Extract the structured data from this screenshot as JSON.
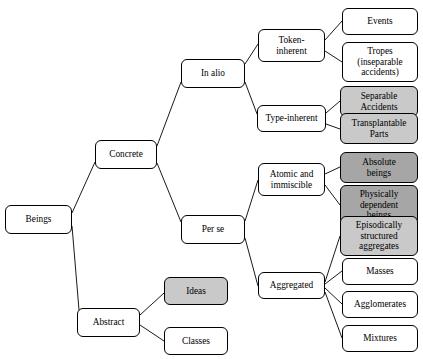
{
  "diagram": {
    "colors": {
      "stroke": "#000000",
      "background": "#ffffff",
      "fill_light": "#c9c9c9",
      "fill_dark": "#a6a6a6"
    },
    "nodes": [
      {
        "id": "beings",
        "label": "Beings",
        "x": 5,
        "y": 205,
        "w": 67,
        "h": 29,
        "fill": "none"
      },
      {
        "id": "concrete",
        "label": "Concrete",
        "x": 95,
        "y": 140,
        "w": 62,
        "h": 29,
        "fill": "none"
      },
      {
        "id": "abstract",
        "label": "Abstract",
        "x": 77,
        "y": 308,
        "w": 63,
        "h": 29,
        "fill": "none"
      },
      {
        "id": "in-alio",
        "label": "In alio",
        "x": 181,
        "y": 59,
        "w": 64,
        "h": 29,
        "fill": "none"
      },
      {
        "id": "per-se",
        "label": "Per se",
        "x": 181,
        "y": 215,
        "w": 64,
        "h": 29,
        "fill": "none"
      },
      {
        "id": "ideas",
        "label": "Ideas",
        "x": 164,
        "y": 277,
        "w": 64,
        "h": 28,
        "fill": "light"
      },
      {
        "id": "classes",
        "label": "Classes",
        "x": 164,
        "y": 327,
        "w": 64,
        "h": 28,
        "fill": "none"
      },
      {
        "id": "token-inherent",
        "label": "Token-\ninherent",
        "x": 258,
        "y": 29,
        "w": 67,
        "h": 33,
        "fill": "none"
      },
      {
        "id": "type-inherent",
        "label": "Type-inherent",
        "x": 257,
        "y": 105,
        "w": 69,
        "h": 27,
        "fill": "none"
      },
      {
        "id": "atomic",
        "label": "Atomic and\nimmiscible",
        "x": 258,
        "y": 163,
        "w": 67,
        "h": 33,
        "fill": "none"
      },
      {
        "id": "aggregated",
        "label": "Aggregated",
        "x": 258,
        "y": 272,
        "w": 67,
        "h": 27,
        "fill": "none"
      },
      {
        "id": "events",
        "label": "Events",
        "x": 342,
        "y": 8,
        "w": 76,
        "h": 27,
        "fill": "none"
      },
      {
        "id": "tropes",
        "label": "Tropes\n(inseparable\naccidents)",
        "x": 342,
        "y": 42,
        "w": 76,
        "h": 40,
        "fill": "none"
      },
      {
        "id": "separable",
        "label": "Separable\nAccidents",
        "x": 340,
        "y": 86,
        "w": 78,
        "h": 31,
        "fill": "light"
      },
      {
        "id": "transplantable",
        "label": "Transplantable\nParts",
        "x": 340,
        "y": 113,
        "w": 78,
        "h": 31,
        "fill": "light"
      },
      {
        "id": "absolute",
        "label": "Absolute\nbeings",
        "x": 340,
        "y": 152,
        "w": 78,
        "h": 31,
        "fill": "dark"
      },
      {
        "id": "physically",
        "label": "Physically\ndependent\nbeings",
        "x": 340,
        "y": 185,
        "w": 78,
        "h": 40,
        "fill": "dark"
      },
      {
        "id": "episodically",
        "label": "Episodically\nstructured\naggregates",
        "x": 340,
        "y": 216,
        "w": 78,
        "h": 40,
        "fill": "light"
      },
      {
        "id": "masses",
        "label": "Masses",
        "x": 342,
        "y": 258,
        "w": 76,
        "h": 27,
        "fill": "none"
      },
      {
        "id": "agglomerates",
        "label": "Agglomerates",
        "x": 342,
        "y": 291,
        "w": 76,
        "h": 27,
        "fill": "none"
      },
      {
        "id": "mixtures",
        "label": "Mixtures",
        "x": 342,
        "y": 325,
        "w": 76,
        "h": 27,
        "fill": "none"
      }
    ],
    "edges": [
      {
        "from": "beings",
        "to": "concrete",
        "x1": 72,
        "y1": 213,
        "x2": 95,
        "y2": 162
      },
      {
        "from": "beings",
        "to": "abstract",
        "x1": 72,
        "y1": 226,
        "x2": 79,
        "y2": 310
      },
      {
        "from": "concrete",
        "to": "in-alio",
        "x1": 157,
        "y1": 146,
        "x2": 181,
        "y2": 82
      },
      {
        "from": "concrete",
        "to": "per-se",
        "x1": 157,
        "y1": 163,
        "x2": 181,
        "y2": 222
      },
      {
        "from": "abstract",
        "to": "ideas",
        "x1": 140,
        "y1": 315,
        "x2": 164,
        "y2": 293
      },
      {
        "from": "abstract",
        "to": "classes",
        "x1": 140,
        "y1": 325,
        "x2": 164,
        "y2": 341
      },
      {
        "from": "in-alio",
        "to": "token-inherent",
        "x1": 245,
        "y1": 64,
        "x2": 258,
        "y2": 44
      },
      {
        "from": "in-alio",
        "to": "type-inherent",
        "x1": 245,
        "y1": 82,
        "x2": 257,
        "y2": 114
      },
      {
        "from": "token-inherent",
        "to": "events",
        "x1": 325,
        "y1": 40,
        "x2": 342,
        "y2": 21
      },
      {
        "from": "token-inherent",
        "to": "tropes",
        "x1": 325,
        "y1": 51,
        "x2": 342,
        "y2": 62
      },
      {
        "from": "type-inherent",
        "to": "separable",
        "x1": 326,
        "y1": 113,
        "x2": 340,
        "y2": 101
      },
      {
        "from": "type-inherent",
        "to": "transplantable",
        "x1": 326,
        "y1": 124,
        "x2": 340,
        "y2": 129
      },
      {
        "from": "per-se",
        "to": "atomic",
        "x1": 245,
        "y1": 221,
        "x2": 258,
        "y2": 180
      },
      {
        "from": "per-se",
        "to": "aggregated",
        "x1": 245,
        "y1": 238,
        "x2": 258,
        "y2": 286
      },
      {
        "from": "atomic",
        "to": "absolute",
        "x1": 325,
        "y1": 174,
        "x2": 340,
        "y2": 167
      },
      {
        "from": "atomic",
        "to": "physically",
        "x1": 325,
        "y1": 185,
        "x2": 340,
        "y2": 205
      },
      {
        "from": "aggregated",
        "to": "episodically",
        "x1": 325,
        "y1": 282,
        "x2": 340,
        "y2": 236
      },
      {
        "from": "aggregated",
        "to": "masses",
        "x1": 325,
        "y1": 284,
        "x2": 342,
        "y2": 271
      },
      {
        "from": "aggregated",
        "to": "agglomerates",
        "x1": 325,
        "y1": 288,
        "x2": 342,
        "y2": 304
      },
      {
        "from": "aggregated",
        "to": "mixtures",
        "x1": 325,
        "y1": 292,
        "x2": 342,
        "y2": 338
      }
    ]
  }
}
